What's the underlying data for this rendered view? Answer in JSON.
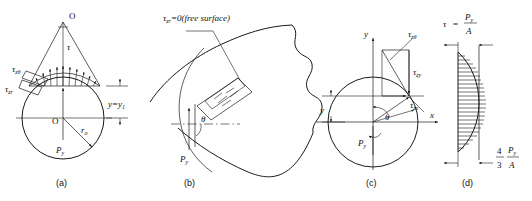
{
  "figure": {
    "caption_a": "(a)",
    "caption_b": "(b)",
    "caption_c": "(c)",
    "caption_d": "(d)"
  },
  "panel_a": {
    "apex_label": "O",
    "center_label": "O",
    "tau_z_theta": "τ",
    "tau_z_theta_sub": "zθ",
    "tau_z_r": "τ",
    "tau_z_r_sub": "zr",
    "tau": "τ",
    "radius_label": "r",
    "radius_sub": "o",
    "force_label": "P",
    "force_sub": "y",
    "y_level": "y=y",
    "y_level_sub": "1"
  },
  "panel_b": {
    "annotation": "τ",
    "annotation_sub": "zr",
    "annotation_rest": "=0(free surface)",
    "theta": "θ",
    "force_label": "P",
    "force_sub": "y"
  },
  "panel_c": {
    "axis_y": "y",
    "axis_x": "x",
    "dim_y": "y",
    "tau_z_theta": "τ",
    "tau_z_theta_sub": "zθ",
    "tau_zy": "τ",
    "tau_zy_sub": "zy",
    "tau_zx": "τ",
    "tau_zx_sub": "zx",
    "theta": "θ",
    "force_label": "P",
    "force_sub": "y"
  },
  "panel_d": {
    "tau_symbol": "τ",
    "equals": "=",
    "num_top": "P",
    "num_top_sub": "y",
    "den_top": "A",
    "frac_whole_num": "4",
    "frac_whole_den": "3",
    "num_bot": "P",
    "num_bot_sub": "y",
    "den_bot": "A"
  },
  "colors": {
    "ink": "#1a1a1a",
    "paper": "#ffffff"
  }
}
